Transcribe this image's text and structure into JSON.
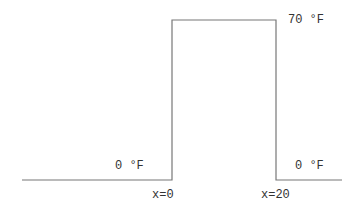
{
  "diagram": {
    "type": "temperature-profile-step",
    "line_color": "#777777",
    "labels": {
      "top_right_temp": "70 °F",
      "left_temp": "0 °F",
      "right_temp": "0 °F",
      "x_left": "x=0",
      "x_right": "x=20"
    },
    "profile": [
      {
        "region": "x<0",
        "temperature_F": 0
      },
      {
        "region": "0<=x<=20",
        "temperature_F": 70
      },
      {
        "region": "x>20",
        "temperature_F": 0
      }
    ]
  }
}
